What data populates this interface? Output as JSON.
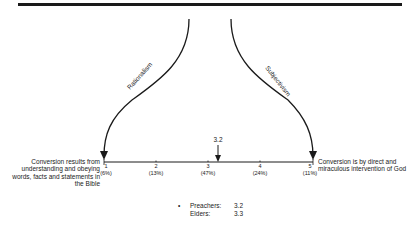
{
  "diagram": {
    "paths": [
      {
        "label": "Rationalism",
        "direction": "left"
      },
      {
        "label": "Subjectivism",
        "direction": "right"
      }
    ],
    "scale": {
      "left_description": "Conversion results from understanding and obeying words, facts and statements in the Bible",
      "right_description": "Conversion is by direct and miraculous intervention of God",
      "ticks": [
        {
          "value": "1",
          "percent": "(6%)"
        },
        {
          "value": "2",
          "percent": "(13%)"
        },
        {
          "value": "3",
          "percent": "(47%)"
        },
        {
          "value": "4",
          "percent": "(24%)"
        },
        {
          "value": "5",
          "percent": "(11%)"
        }
      ],
      "marker_value": "3.2"
    },
    "legend": {
      "bullet": "•",
      "rows": [
        {
          "name": "Preachers:",
          "value": "3.2"
        },
        {
          "name": "Elders:",
          "value": "3.3"
        }
      ]
    }
  }
}
